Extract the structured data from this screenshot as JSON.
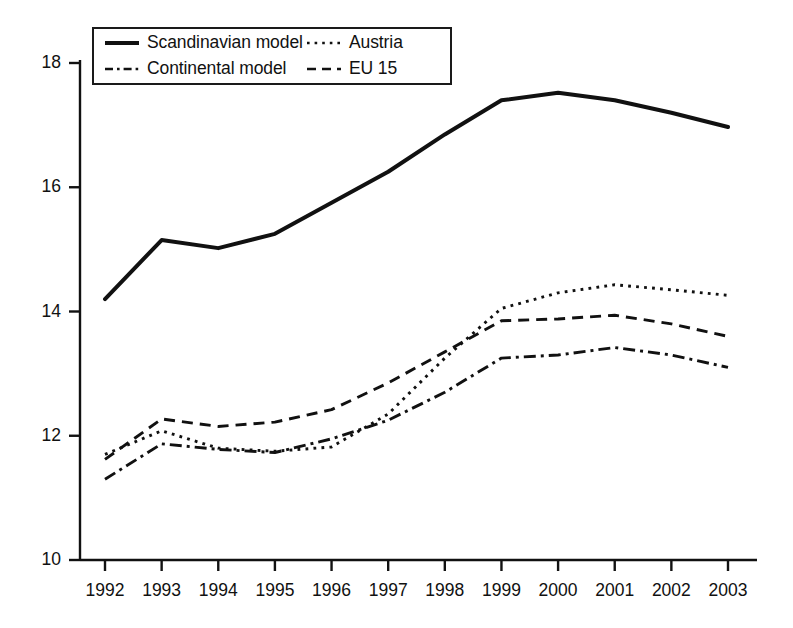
{
  "chart_data": {
    "type": "line",
    "title": "",
    "subtitle": "",
    "xlabel": "",
    "ylabel": "",
    "x": [
      1992,
      1993,
      1994,
      1995,
      1996,
      1997,
      1998,
      1999,
      2000,
      2001,
      2002,
      2003
    ],
    "categories": [
      "1992",
      "1993",
      "1994",
      "1995",
      "1996",
      "1997",
      "1998",
      "1999",
      "2000",
      "2001",
      "2002",
      "2003"
    ],
    "xlim": [
      1992,
      2003
    ],
    "ylim": [
      10,
      18
    ],
    "yticks": [
      10,
      12,
      14,
      16,
      18
    ],
    "ytick_labels": [
      "10",
      "12",
      "14",
      "16",
      "18"
    ],
    "grid": false,
    "legend_position": "top-left",
    "series": [
      {
        "name": "Scandinavian model",
        "style": "solid",
        "color": "#111111",
        "values": [
          14.2,
          15.15,
          15.02,
          15.25,
          15.75,
          16.25,
          16.85,
          17.4,
          17.52,
          17.4,
          17.2,
          16.97
        ]
      },
      {
        "name": "Austria",
        "style": "dotted",
        "color": "#111111",
        "values": [
          11.7,
          12.08,
          11.8,
          11.75,
          11.82,
          12.35,
          13.25,
          14.05,
          14.3,
          14.43,
          14.35,
          14.26
        ]
      },
      {
        "name": "Continental model",
        "style": "dash-dot",
        "color": "#111111",
        "values": [
          11.3,
          11.87,
          11.78,
          11.73,
          11.95,
          12.25,
          12.7,
          13.25,
          13.3,
          13.42,
          13.3,
          13.1
        ]
      },
      {
        "name": "EU 15",
        "style": "dashed",
        "color": "#111111",
        "values": [
          11.62,
          12.27,
          12.15,
          12.22,
          12.42,
          12.85,
          13.35,
          13.85,
          13.88,
          13.94,
          13.8,
          13.6
        ]
      }
    ]
  },
  "legend": {
    "entries": [
      {
        "label": "Scandinavian model",
        "style": "solid"
      },
      {
        "label": "Austria",
        "style": "dotted"
      },
      {
        "label": "Continental model",
        "style": "dash-dot"
      },
      {
        "label": "EU 15",
        "style": "dashed"
      }
    ]
  },
  "axes": {
    "y_tick_labels": [
      "18",
      "16",
      "14",
      "12",
      "10"
    ],
    "x_tick_labels": [
      "1992",
      "1993",
      "1994",
      "1995",
      "1996",
      "1997",
      "1998",
      "1999",
      "2000",
      "2001",
      "2002",
      "2003"
    ]
  },
  "colors": {
    "line": "#111111",
    "axis": "#111111",
    "background": "#ffffff"
  }
}
